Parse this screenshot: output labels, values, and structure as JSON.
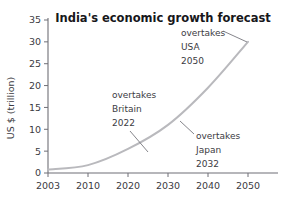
{
  "chart_data": {
    "type": "line",
    "title": "India's economic growth forecast",
    "xlabel": "",
    "ylabel": "US $ (trillion)",
    "x": [
      2003,
      2010,
      2020,
      2030,
      2040,
      2050
    ],
    "values": [
      0.8,
      1.8,
      5.5,
      11.0,
      19.5,
      30.0
    ],
    "series": [
      {
        "name": "India GDP forecast",
        "values": [
          0.8,
          1.8,
          5.5,
          11.0,
          19.5,
          30.0
        ]
      }
    ],
    "xtick_labels": [
      "2003",
      "2010",
      "2020",
      "2030",
      "2040",
      "2050"
    ],
    "ytick_labels": [
      "0",
      "5",
      "10",
      "15",
      "20",
      "25",
      "30",
      "35"
    ],
    "ytick_values": [
      0,
      5,
      10,
      15,
      20,
      25,
      30,
      35
    ],
    "ylim": [
      0,
      35
    ],
    "grid": false,
    "legend": false,
    "legend_position": "none",
    "line_color": "#b9b9bd",
    "axis_color": "#6f6f76",
    "text_color": "#3b3b42",
    "title_color": "#17171b",
    "annotations": [
      {
        "id": "britain",
        "lines": [
          "overtakes",
          "Britain",
          "2022"
        ],
        "target_x": 2022,
        "target_y": 6.2
      },
      {
        "id": "usa",
        "lines": [
          "overtakes",
          "USA",
          "2050"
        ],
        "target_x": 2050,
        "target_y": 30.0
      },
      {
        "id": "japan",
        "lines": [
          "overtakes",
          "Japan",
          "2032"
        ],
        "target_x": 2031,
        "target_y": 12.0
      }
    ]
  }
}
